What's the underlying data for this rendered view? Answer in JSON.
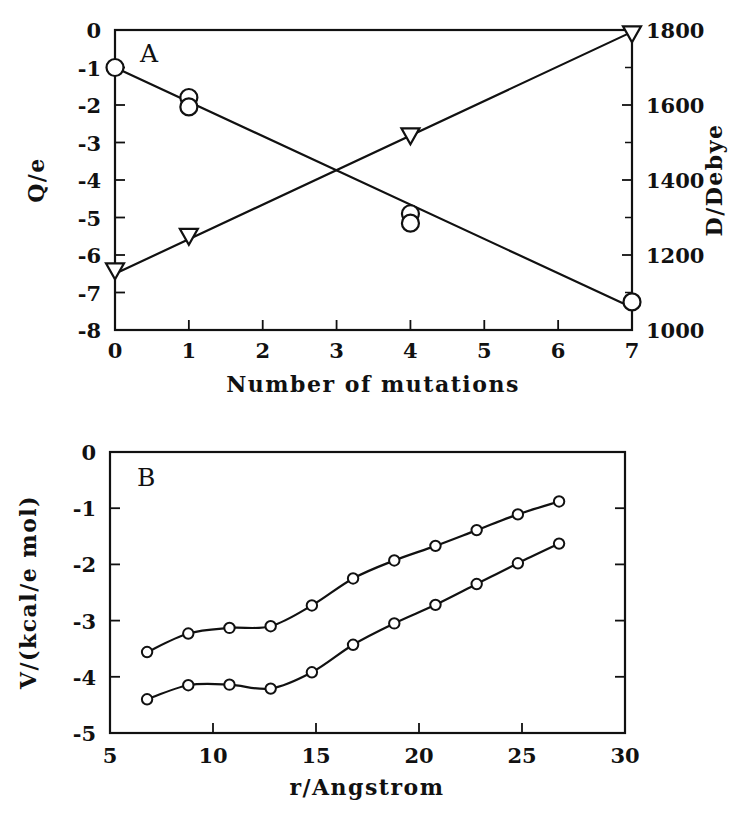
{
  "figure": {
    "panels": [
      "A",
      "B"
    ],
    "background": "#ffffff",
    "ink": "#111111"
  },
  "panelA": {
    "letter": "A",
    "xlabel": "Number of mutations",
    "ylabel_left": "Q/e",
    "ylabel_right": "D/Debye",
    "xticks": [
      "0",
      "1",
      "2",
      "3",
      "4",
      "5",
      "6",
      "7"
    ],
    "yticks_left": [
      "0",
      "-1",
      "-2",
      "-3",
      "-4",
      "-5",
      "-6",
      "-7",
      "-8"
    ],
    "yticks_right": [
      "1800",
      "1600",
      "1400",
      "1200",
      "1000"
    ]
  },
  "panelB": {
    "letter": "B",
    "xlabel": "r/Angstrom",
    "ylabel": "V/(kcal/e mol)",
    "xticks": [
      "5",
      "10",
      "15",
      "20",
      "25",
      "30"
    ],
    "yticks": [
      "0",
      "-1",
      "-2",
      "-3",
      "-4",
      "-5"
    ]
  },
  "chart_data": [
    {
      "type": "scatter",
      "panel": "A",
      "title": "A",
      "xlabel": "Number of mutations",
      "ylabel": "Q/e",
      "ylabel_secondary": "D/Debye",
      "xlim": [
        0,
        7
      ],
      "ylim": [
        -8,
        0
      ],
      "ylim_secondary": [
        1000,
        1800
      ],
      "grid": false,
      "legend": "none",
      "xticks": [
        0,
        1,
        2,
        3,
        4,
        5,
        6,
        7
      ],
      "yticks": [
        0,
        -1,
        -2,
        -3,
        -4,
        -5,
        -6,
        -7,
        -8
      ],
      "yticks_secondary": [
        1000,
        1200,
        1400,
        1600,
        1800
      ],
      "series": [
        {
          "name": "Charge Q/e (circles, left axis)",
          "marker": "open-circle",
          "axis": "left",
          "x": [
            0,
            1,
            1,
            4,
            4,
            7
          ],
          "y": [
            -1.0,
            -1.8,
            -2.05,
            -4.9,
            -5.15,
            -7.25
          ],
          "fit_line": {
            "x": [
              0,
              7
            ],
            "y": [
              -1.0,
              -7.4
            ]
          }
        },
        {
          "name": "Dipole moment D/Debye (triangles, right axis)",
          "marker": "open-down-triangle",
          "axis": "right",
          "x": [
            0,
            1,
            4,
            7
          ],
          "y": [
            1158,
            1250,
            1518,
            1790
          ],
          "fit_line": {
            "x": [
              0,
              7
            ],
            "y": [
              1150,
              1795
            ]
          }
        }
      ]
    },
    {
      "type": "line",
      "panel": "B",
      "title": "B",
      "xlabel": "r/Angstrom",
      "ylabel": "V/(kcal/e mol)",
      "xlim": [
        5,
        30
      ],
      "ylim": [
        -5,
        0
      ],
      "grid": false,
      "legend": "none",
      "xticks": [
        5,
        10,
        15,
        20,
        25,
        30
      ],
      "yticks": [
        0,
        -1,
        -2,
        -3,
        -4,
        -5
      ],
      "series": [
        {
          "name": "upper curve",
          "marker": "open-circle",
          "x": [
            6.8,
            8.8,
            10.8,
            12.8,
            14.8,
            16.8,
            18.8,
            20.8,
            22.8,
            24.8,
            26.8
          ],
          "y": [
            -3.56,
            -3.23,
            -3.13,
            -3.1,
            -2.73,
            -2.25,
            -1.93,
            -1.67,
            -1.39,
            -1.11,
            -0.88
          ]
        },
        {
          "name": "lower curve",
          "marker": "open-circle",
          "x": [
            6.8,
            8.8,
            10.8,
            12.8,
            14.8,
            16.8,
            18.8,
            20.8,
            22.8,
            24.8,
            26.8
          ],
          "y": [
            -4.4,
            -4.15,
            -4.14,
            -4.21,
            -3.92,
            -3.43,
            -3.05,
            -2.72,
            -2.35,
            -1.98,
            -1.63
          ]
        }
      ]
    }
  ]
}
